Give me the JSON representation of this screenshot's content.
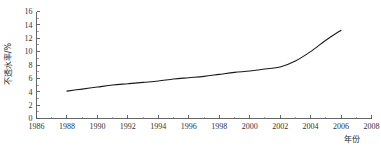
{
  "chart_data": {
    "type": "line",
    "title": "",
    "subtitle": "",
    "xlabel": "年份",
    "ylabel": "不透水率/%",
    "xlim": [
      1986,
      2008
    ],
    "ylim": [
      0,
      16
    ],
    "grid": false,
    "legend": null,
    "x_ticks": [
      1986,
      1988,
      1990,
      1992,
      1994,
      1996,
      1998,
      2000,
      2002,
      2004,
      2006,
      2008
    ],
    "x_tick_labels": [
      "1986",
      "1988",
      "1990",
      "1992",
      "1994",
      "1996",
      "1998",
      "2000",
      "2002",
      "2004",
      "2006",
      "2008"
    ],
    "x_minor_tick_step": 1,
    "y_ticks": [
      0,
      2,
      4,
      6,
      8,
      10,
      12,
      14,
      16
    ],
    "y_tick_labels": [
      "0",
      "2",
      "4",
      "6",
      "8",
      "10",
      "12",
      "14",
      "16"
    ],
    "y_minor_tick_step": 1,
    "series": [
      {
        "name": "不透水率",
        "color": "#1a1a1a",
        "x": [
          1988,
          1989,
          1990,
          1991,
          1992,
          1993,
          1994,
          1995,
          1996,
          1997,
          1998,
          1999,
          2000,
          2001,
          2002,
          2003,
          2004,
          2005,
          2006
        ],
        "values": [
          4.1,
          4.4,
          4.7,
          5.0,
          5.2,
          5.4,
          5.6,
          5.9,
          6.1,
          6.3,
          6.6,
          6.9,
          7.1,
          7.4,
          7.7,
          8.6,
          10.0,
          11.7,
          13.2
        ]
      }
    ]
  },
  "axes": {
    "y_axis_title": "不透水率/%",
    "x_axis_title": "年份"
  }
}
